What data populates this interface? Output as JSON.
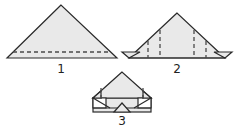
{
  "diagram": {
    "type": "origami fold steps",
    "colors": {
      "paper": "#e9e9e9",
      "stroke": "#2a2a2a",
      "background": "#ffffff"
    },
    "steps": [
      {
        "label": "1",
        "description": "Triangle with horizontal dashed fold line near base"
      },
      {
        "label": "2",
        "description": "Triangle with bottom corners folded out and four vertical dashed fold lines"
      },
      {
        "label": "3",
        "description": "Sides folded in forming house shape with band at bottom"
      }
    ]
  }
}
